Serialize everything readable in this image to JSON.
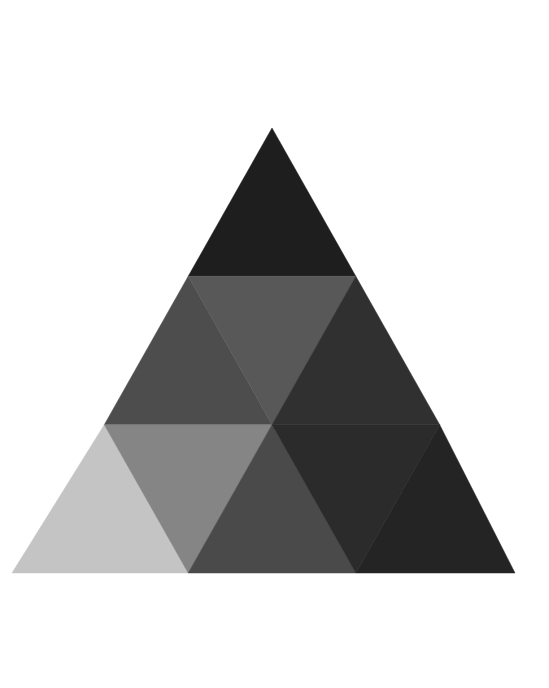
{
  "canvas": {
    "width": 549,
    "height": 688,
    "background_color": "#ffffff",
    "title": "Subdivided Triangle"
  },
  "figure": {
    "name": "subdivided-equilateral-triangle",
    "shape": "triangle",
    "rows": 3,
    "tile_count": 9,
    "apex": {
      "x": 272,
      "y": 128
    },
    "base_left": {
      "x": 12,
      "y": 573
    },
    "base_right": {
      "x": 515,
      "y": 573
    },
    "height": 445,
    "base_width": 503,
    "row_boundaries_y": [
      128,
      276.3,
      424.7,
      573
    ],
    "outline": "none",
    "gap": 0
  },
  "chart_data": {
    "type": "heatmap",
    "subtitle": "",
    "xlabel": "",
    "ylabel": "",
    "grid": false,
    "legend": "none",
    "colorscale": "grayscale",
    "rows": [
      {
        "row": 1,
        "tiles": [
          {
            "id": "r1-t1",
            "orientation": "up",
            "color": "#1e1e1e",
            "gray_value": 30,
            "label": "apex"
          }
        ]
      },
      {
        "row": 2,
        "tiles": [
          {
            "id": "r2-t1",
            "orientation": "up",
            "color": "#4d4d4d",
            "gray_value": 77,
            "label": "upper-left"
          },
          {
            "id": "r2-t2",
            "orientation": "down",
            "color": "#585858",
            "gray_value": 88,
            "label": "upper-center"
          },
          {
            "id": "r2-t3",
            "orientation": "up",
            "color": "#303030",
            "gray_value": 48,
            "label": "upper-right"
          }
        ]
      },
      {
        "row": 3,
        "tiles": [
          {
            "id": "r3-t1",
            "orientation": "up",
            "color": "#c4c4c4",
            "gray_value": 196,
            "label": "bottom-left"
          },
          {
            "id": "r3-t2",
            "orientation": "down",
            "color": "#858585",
            "gray_value": 133,
            "label": "bottom-left-inner"
          },
          {
            "id": "r3-t3",
            "orientation": "up",
            "color": "#4a4a4a",
            "gray_value": 74,
            "label": "bottom-center"
          },
          {
            "id": "r3-t4",
            "orientation": "down",
            "color": "#2b2b2b",
            "gray_value": 43,
            "label": "bottom-right-inner"
          },
          {
            "id": "r3-t5",
            "orientation": "up",
            "color": "#242424",
            "gray_value": 36,
            "label": "bottom-right"
          }
        ]
      }
    ],
    "values": [
      30,
      77,
      88,
      48,
      196,
      133,
      74,
      43,
      36
    ],
    "categories": [
      "apex",
      "upper-left",
      "upper-center",
      "upper-right",
      "bottom-left",
      "bottom-left-inner",
      "bottom-center",
      "bottom-right-inner",
      "bottom-right"
    ]
  }
}
